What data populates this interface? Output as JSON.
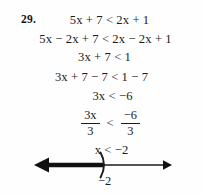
{
  "problem": {
    "number": "29.",
    "steps": [
      "5x + 7 < 2x + 1",
      "5x − 2x + 7 < 2x − 2x + 1",
      "3x + 7 < 1",
      "3x + 7 − 7 < 1 − 7",
      "3x < −6",
      "x < −2"
    ],
    "fraction_step": {
      "left_numerator": "3x",
      "left_denominator": "3",
      "operator": "<",
      "right_numerator": "−6",
      "right_denominator": "3"
    },
    "solution": "x < −2"
  },
  "number_line": {
    "endpoint_label": "−2",
    "endpoint_symbol": ")",
    "endpoint_type": "open",
    "shaded_direction": "left",
    "left_arrow": "left-arrow",
    "right_arrow": "right-arrow",
    "colors": {
      "ink": "#111111",
      "line": "#1b1b1b",
      "background": "#fefefe"
    }
  }
}
